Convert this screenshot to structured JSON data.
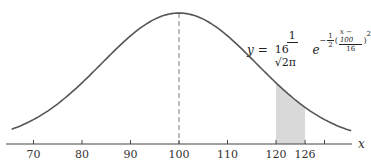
{
  "chart_data": {
    "type": "line",
    "title": "",
    "xlabel": "x",
    "ylabel": "",
    "distribution": "normal",
    "mean": 100,
    "std_dev": 16,
    "equation": "y = 1/(16√(2π)) e^(-1/2((x-100)/16)^2)",
    "x_ticks": [
      70,
      80,
      90,
      100,
      110,
      120,
      126,
      130
    ],
    "x_tick_labels": [
      "70",
      "80",
      "90",
      "100",
      "110",
      "120",
      "126",
      ""
    ],
    "xlim": [
      64,
      140
    ],
    "shaded_region": {
      "from": 120,
      "to": 126,
      "color": "#d9d9d9"
    },
    "mean_line": {
      "x": 100,
      "style": "dashed"
    },
    "grid": false,
    "legend": "none",
    "colors": {
      "curve": "#555555",
      "axis": "#444444",
      "shade": "#d9d9d9"
    }
  },
  "labels": {
    "axis_x": "x",
    "eq_y": "y",
    "eq_equals": "=",
    "eq_num": "1",
    "eq_den": "16 √2π",
    "eq_e": "e",
    "eq_minus": "−",
    "eq_half_n": "1",
    "eq_half_d": "2",
    "eq_inner_n": "x − 100",
    "eq_inner_d": "16",
    "eq_sq": "2",
    "ticks": [
      "70",
      "80",
      "90",
      "100",
      "110",
      "120",
      "126"
    ]
  }
}
